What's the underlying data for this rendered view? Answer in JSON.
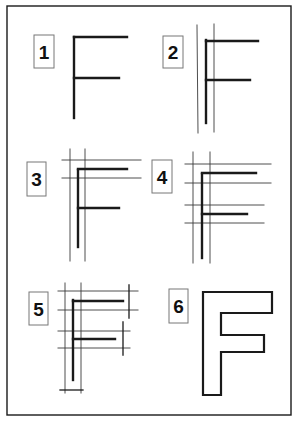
{
  "colors": {
    "background": "#ffffff",
    "stroke": "#1a1a1a",
    "guide": "#3a3a3a",
    "label_box": "#777777"
  },
  "frame": {
    "x": 7,
    "y": 6,
    "width": 284,
    "height": 409
  },
  "panels": [
    {
      "id": 1,
      "label": "1",
      "label_box": {
        "x": 34,
        "y": 35,
        "w": 20,
        "h": 33
      },
      "guides": [],
      "ticks": [],
      "letter": [
        [
          74,
          37,
          74,
          118
        ],
        [
          74,
          37,
          127,
          37
        ],
        [
          74,
          78,
          119,
          78
        ]
      ]
    },
    {
      "id": 2,
      "label": "2",
      "label_box": {
        "x": 163,
        "y": 36,
        "w": 20,
        "h": 32
      },
      "guides": [
        [
          197,
          25,
          198,
          133
        ],
        [
          214,
          24,
          214,
          132
        ]
      ],
      "ticks": [],
      "letter": [
        [
          206,
          40,
          206,
          123
        ],
        [
          206,
          41,
          258,
          41
        ],
        [
          206,
          80,
          250,
          80
        ]
      ]
    },
    {
      "id": 3,
      "label": "3",
      "label_box": {
        "x": 27,
        "y": 162,
        "w": 19,
        "h": 34
      },
      "guides": [
        [
          70,
          149,
          70,
          261
        ],
        [
          85,
          149,
          85,
          261
        ],
        [
          62,
          160,
          141,
          160
        ],
        [
          62,
          178,
          141,
          178
        ]
      ],
      "ticks": [],
      "letter": [
        [
          78,
          170,
          78,
          247
        ],
        [
          78,
          169,
          127,
          169
        ],
        [
          78,
          208,
          119,
          208
        ]
      ]
    },
    {
      "id": 4,
      "label": "4",
      "label_box": {
        "x": 152,
        "y": 160,
        "w": 20,
        "h": 33
      },
      "guides": [
        [
          193,
          152,
          193,
          263
        ],
        [
          210,
          152,
          210,
          263
        ],
        [
          185,
          164,
          271,
          164
        ],
        [
          185,
          183,
          271,
          183
        ],
        [
          185,
          205,
          264,
          205
        ],
        [
          185,
          223,
          264,
          223
        ]
      ],
      "ticks": [],
      "letter": [
        [
          202,
          174,
          202,
          258
        ],
        [
          202,
          173,
          256,
          173
        ],
        [
          202,
          214,
          247,
          214
        ]
      ]
    },
    {
      "id": 5,
      "label": "5",
      "label_box": {
        "x": 29,
        "y": 292,
        "w": 19,
        "h": 33
      },
      "guides": [
        [
          65,
          283,
          65,
          393
        ],
        [
          81,
          283,
          81,
          393
        ],
        [
          58,
          291,
          138,
          291
        ],
        [
          58,
          310,
          138,
          310
        ],
        [
          58,
          331,
          130,
          331
        ],
        [
          58,
          348,
          130,
          348
        ]
      ],
      "ticks": [
        [
          129,
          285,
          129,
          318
        ],
        [
          123,
          322,
          123,
          355
        ],
        [
          60,
          390,
          83,
          390
        ]
      ],
      "letter": [
        [
          73,
          300,
          73,
          380
        ],
        [
          73,
          301,
          123,
          301
        ],
        [
          73,
          339,
          115,
          339
        ]
      ]
    },
    {
      "id": 6,
      "label": "6",
      "label_box": {
        "x": 169,
        "y": 289,
        "w": 19,
        "h": 34
      },
      "guides": [],
      "ticks": [],
      "outline": "203,292 272,292 272,313 221,313 221,335 264,335 264,352 221,352 221,395 203,395"
    }
  ]
}
